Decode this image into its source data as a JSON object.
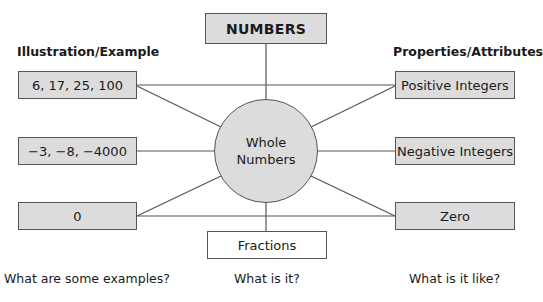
{
  "diagram": {
    "type": "concept map (Frayer-style)",
    "top_box": {
      "label": "NUMBERS"
    },
    "center": {
      "line1": "Whole",
      "line2": "Numbers"
    },
    "bottom_box": {
      "label": "Fractions"
    },
    "left_heading": "Illustration/Example",
    "right_heading": "Properties/Attributes",
    "left_boxes": [
      {
        "label": "6, 17, 25, 100"
      },
      {
        "label": "−3, −8, −4000"
      },
      {
        "label": "0"
      }
    ],
    "right_boxes": [
      {
        "label": "Positive Integers"
      },
      {
        "label": "Negative Integers"
      },
      {
        "label": "Zero"
      }
    ],
    "questions": {
      "left": "What are some examples?",
      "center": "What is it?",
      "right": "What is it like?"
    },
    "colors": {
      "box_fill": "#dcdcdc",
      "border": "#555555",
      "line": "#555555",
      "background": "#ffffff"
    }
  }
}
